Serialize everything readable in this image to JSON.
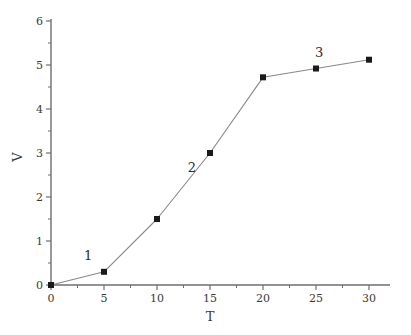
{
  "chart_data": {
    "type": "line",
    "title": "",
    "subtitle": "",
    "xlabel": "T",
    "ylabel": "V",
    "xlim": [
      0,
      32
    ],
    "ylim": [
      0,
      6
    ],
    "grid": false,
    "legend": null,
    "x": [
      0,
      5,
      10,
      15,
      20,
      25,
      30
    ],
    "series": [
      {
        "name": "V",
        "values": [
          0,
          0.3,
          1.5,
          3.0,
          4.72,
          4.92,
          5.12
        ],
        "marker": "square",
        "marker_color": "#1a1a1a",
        "line_color": "#888888"
      }
    ],
    "x_ticks": [
      0,
      5,
      10,
      15,
      20,
      25,
      30
    ],
    "x_tick_labels": [
      "0",
      "5",
      "10",
      "15",
      "20",
      "25",
      "30"
    ],
    "x_minor_ticks": [
      2.5,
      7.5,
      12.5,
      17.5,
      22.5,
      27.5
    ],
    "y_ticks": [
      0,
      1,
      2,
      3,
      4,
      5,
      6
    ],
    "y_tick_labels": [
      "0",
      "1",
      "2",
      "3",
      "4",
      "5",
      "6"
    ],
    "y_minor_ticks": [
      0.5,
      1.5,
      2.5,
      3.5,
      4.5,
      5.5
    ],
    "annotations": [
      {
        "label": "1",
        "x": 3.5,
        "y": 0.68
      },
      {
        "label": "2",
        "x": 13.3,
        "y": 2.69
      },
      {
        "label": "3",
        "x": 25.3,
        "y": 5.3
      }
    ]
  },
  "style": {
    "axis_color": "#6e6e6e",
    "text_color": "#3a3a3a",
    "line_color": "#8a8a8a",
    "marker_color": "#1a1a1a",
    "background": "#ffffff"
  }
}
